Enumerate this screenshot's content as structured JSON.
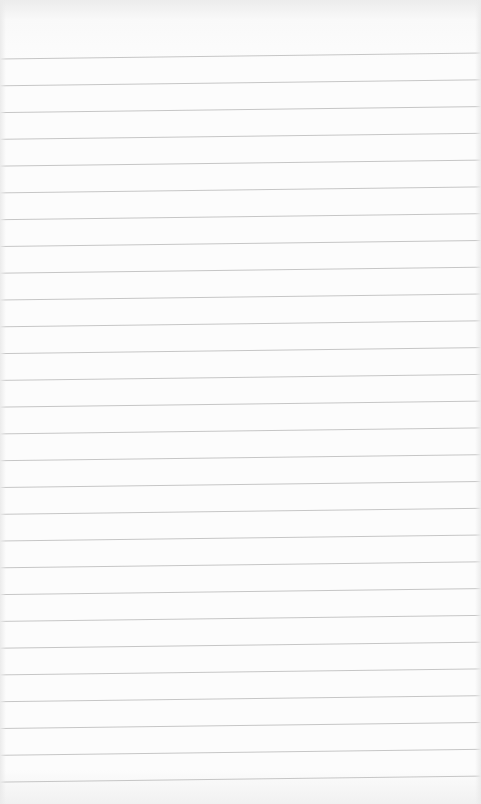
{
  "paper": {
    "type": "ruled notepad sheet",
    "background_color": "#fcfcfc",
    "line_color": "#c6c6c6",
    "line_count": 28,
    "first_line_left_y": 59,
    "line_spacing": 26.78,
    "tilt_px": 6,
    "text": ""
  }
}
